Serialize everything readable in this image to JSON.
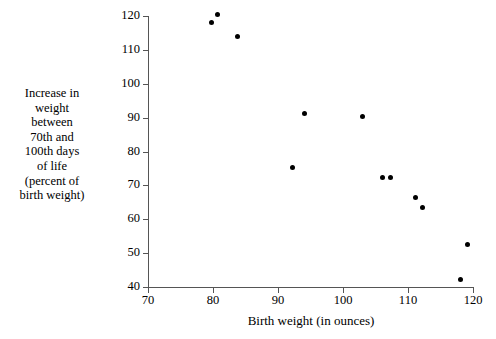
{
  "chart_data": {
    "type": "scatter",
    "title": "",
    "xlabel": "Birth weight (in ounces)",
    "ylabel": "Increase in weight between 70th and 100th days of life (percent of birth weight)",
    "xlim": [
      70,
      120
    ],
    "ylim": [
      40,
      120
    ],
    "xticks": [
      70,
      80,
      90,
      100,
      110,
      120
    ],
    "yticks": [
      40,
      50,
      60,
      70,
      80,
      90,
      100,
      110,
      120
    ],
    "grid": false,
    "legend": false,
    "marker": "filled-circle",
    "marker_color": "#000000",
    "points": [
      {
        "x": 79.8,
        "y": 118.0
      },
      {
        "x": 80.7,
        "y": 120.5
      },
      {
        "x": 83.8,
        "y": 114.0
      },
      {
        "x": 92.2,
        "y": 75.4
      },
      {
        "x": 94.0,
        "y": 91.2
      },
      {
        "x": 103.0,
        "y": 90.4
      },
      {
        "x": 106.1,
        "y": 72.3
      },
      {
        "x": 107.3,
        "y": 72.3
      },
      {
        "x": 111.1,
        "y": 66.5
      },
      {
        "x": 112.3,
        "y": 63.4
      },
      {
        "x": 118.0,
        "y": 42.3
      },
      {
        "x": 119.1,
        "y": 52.4
      }
    ]
  },
  "axes": {
    "y_title_lines": [
      "Increase in",
      "weight",
      "between",
      "70th and",
      "100th days",
      "of life",
      "(percent of",
      "birth weight)"
    ],
    "x_title": "Birth weight (in ounces)"
  }
}
